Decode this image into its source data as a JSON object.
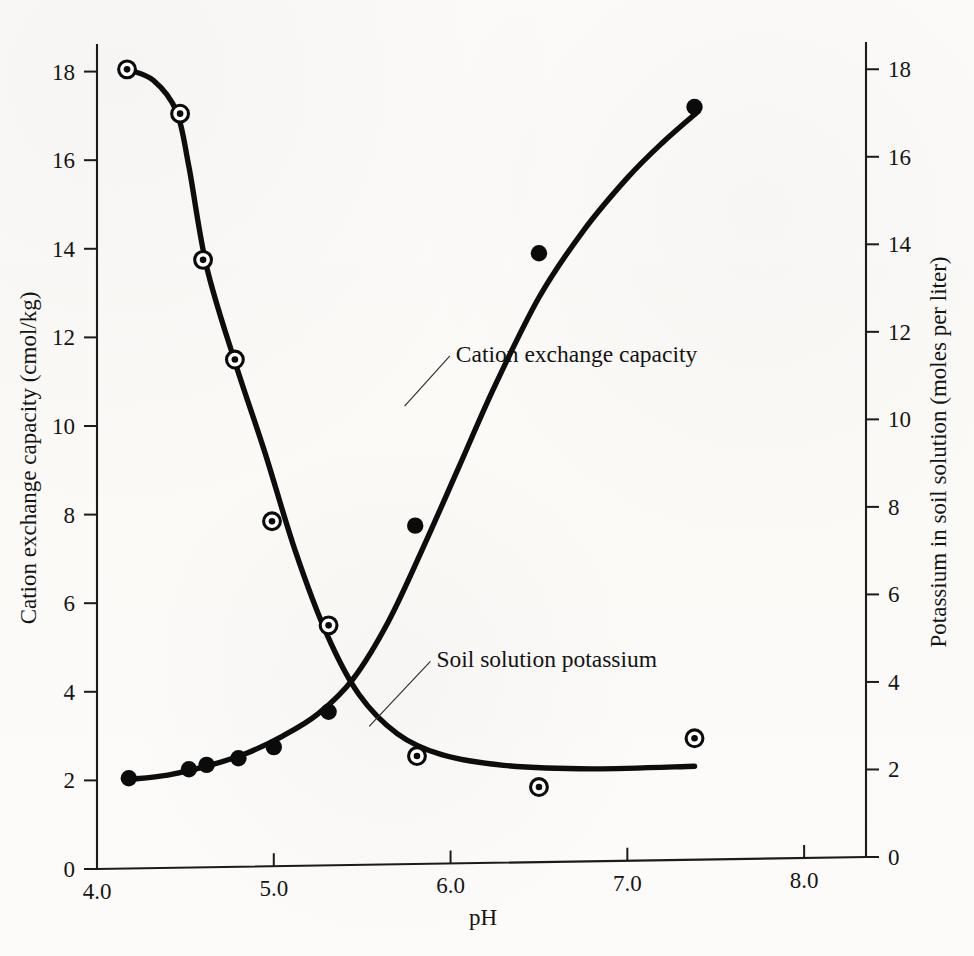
{
  "chart_data": {
    "type": "line",
    "title": "",
    "xlabel": "pH",
    "ylabel": "Cation exchange capacity (cmol/kg)",
    "y2label": "Potassium in soil solution (moles per liter)",
    "xlim": [
      4.0,
      8.35
    ],
    "ylim": [
      0,
      18.6
    ],
    "y2lim": [
      0,
      18.6
    ],
    "xticks": [
      "4.0",
      "5.0",
      "6.0",
      "7.0",
      "8.0"
    ],
    "xtick_values": [
      4.0,
      5.0,
      6.0,
      7.0,
      8.0
    ],
    "yticks": [
      "0",
      "2",
      "4",
      "6",
      "8",
      "10",
      "12",
      "14",
      "16",
      "18"
    ],
    "ytick_values": [
      0,
      2,
      4,
      6,
      8,
      10,
      12,
      14,
      16,
      18
    ],
    "y2ticks": [
      "0",
      "2",
      "4",
      "6",
      "8",
      "10",
      "12",
      "14",
      "16",
      "18"
    ],
    "y2tick_values": [
      0,
      2,
      4,
      6,
      8,
      10,
      12,
      14,
      16,
      18
    ],
    "grid": false,
    "legend_position": "inline-annotations",
    "series": [
      {
        "name": "Cation exchange capacity",
        "axis": "left",
        "marker": "circle-dot",
        "annotation": "Cation exchange capacity",
        "annotation_x": 6.03,
        "annotation_y": 11.45,
        "leader_from_x": 5.74,
        "leader_from_y": 10.45,
        "points": [
          {
            "x": 4.17,
            "y": 18.05
          },
          {
            "x": 4.47,
            "y": 17.05
          },
          {
            "x": 4.6,
            "y": 13.75
          },
          {
            "x": 4.78,
            "y": 11.5
          },
          {
            "x": 4.99,
            "y": 7.85
          },
          {
            "x": 5.31,
            "y": 5.5
          },
          {
            "x": 5.81,
            "y": 2.55
          },
          {
            "x": 6.5,
            "y": 1.85
          },
          {
            "x": 7.38,
            "y": 2.95
          }
        ],
        "curve": [
          {
            "x": 4.17,
            "y": 18.05
          },
          {
            "x": 4.32,
            "y": 17.8
          },
          {
            "x": 4.45,
            "y": 17.1
          },
          {
            "x": 4.52,
            "y": 15.85
          },
          {
            "x": 4.62,
            "y": 13.6
          },
          {
            "x": 4.78,
            "y": 11.45
          },
          {
            "x": 4.95,
            "y": 9.4
          },
          {
            "x": 5.12,
            "y": 7.2
          },
          {
            "x": 5.3,
            "y": 5.3
          },
          {
            "x": 5.48,
            "y": 3.95
          },
          {
            "x": 5.7,
            "y": 3.05
          },
          {
            "x": 5.95,
            "y": 2.58
          },
          {
            "x": 6.3,
            "y": 2.34
          },
          {
            "x": 6.8,
            "y": 2.26
          },
          {
            "x": 7.38,
            "y": 2.32
          }
        ]
      },
      {
        "name": "Soil solution potassium",
        "axis": "right",
        "marker": "filled-circle",
        "annotation": "Soil solution potassium",
        "annotation_x": 5.92,
        "annotation_y": 4.55,
        "leader_from_x": 5.54,
        "leader_from_y": 3.22,
        "points": [
          {
            "x": 4.18,
            "y": 2.05
          },
          {
            "x": 4.52,
            "y": 2.25
          },
          {
            "x": 4.62,
            "y": 2.35
          },
          {
            "x": 4.8,
            "y": 2.5
          },
          {
            "x": 5.0,
            "y": 2.75
          },
          {
            "x": 5.31,
            "y": 3.55
          },
          {
            "x": 5.8,
            "y": 7.75
          },
          {
            "x": 6.5,
            "y": 13.9
          },
          {
            "x": 7.38,
            "y": 17.2
          }
        ],
        "curve": [
          {
            "x": 4.18,
            "y": 2.02
          },
          {
            "x": 4.4,
            "y": 2.12
          },
          {
            "x": 4.62,
            "y": 2.32
          },
          {
            "x": 4.85,
            "y": 2.62
          },
          {
            "x": 5.05,
            "y": 3.0
          },
          {
            "x": 5.25,
            "y": 3.5
          },
          {
            "x": 5.45,
            "y": 4.3
          },
          {
            "x": 5.65,
            "y": 5.6
          },
          {
            "x": 5.85,
            "y": 7.3
          },
          {
            "x": 6.05,
            "y": 9.1
          },
          {
            "x": 6.25,
            "y": 10.9
          },
          {
            "x": 6.5,
            "y": 12.9
          },
          {
            "x": 6.75,
            "y": 14.4
          },
          {
            "x": 7.0,
            "y": 15.6
          },
          {
            "x": 7.2,
            "y": 16.4
          },
          {
            "x": 7.4,
            "y": 17.1
          }
        ]
      }
    ]
  },
  "labels": {
    "x_axis_title": "pH",
    "left_axis_title": "Cation exchange capacity (cmol/kg)",
    "right_axis_title": "Potassium in soil solution (moles per liter)",
    "annotation_cec": "Cation exchange capacity",
    "annotation_k": "Soil solution potassium"
  },
  "style": {
    "curve_color": "#0d0d0d",
    "axis_color": "#1b1b1b",
    "text_color": "#141414",
    "background": "#fbfaf8"
  }
}
